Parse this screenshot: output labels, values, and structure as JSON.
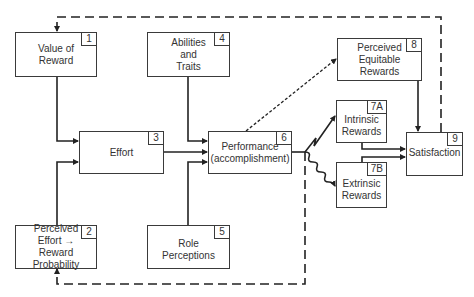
{
  "diagram": {
    "title": "",
    "type": "flowchart",
    "nodes": [
      {
        "id": "1",
        "number": "1",
        "label": "Value of\nReward"
      },
      {
        "id": "2",
        "number": "2",
        "label": "Perceived\nEffort → Reward\nProbability"
      },
      {
        "id": "3",
        "number": "3",
        "label": "Effort"
      },
      {
        "id": "4",
        "number": "4",
        "label": "Abilities\nand\nTraits"
      },
      {
        "id": "5",
        "number": "5",
        "label": "Role Perceptions"
      },
      {
        "id": "6",
        "number": "6",
        "label": "Performance\n(accomplishment)"
      },
      {
        "id": "7A",
        "number": "7A",
        "label": "Intrinsic\nRewards"
      },
      {
        "id": "7B",
        "number": "7B",
        "label": "Extrinsic\nRewards"
      },
      {
        "id": "8",
        "number": "8",
        "label": "Perceived\nEquitable\nRewards"
      },
      {
        "id": "9",
        "number": "9",
        "label": "Satisfaction"
      }
    ],
    "edges": [
      {
        "from": "1",
        "to": "3",
        "style": "solid"
      },
      {
        "from": "2",
        "to": "3",
        "style": "solid"
      },
      {
        "from": "3",
        "to": "6",
        "style": "solid"
      },
      {
        "from": "4",
        "to": "6",
        "style": "solid"
      },
      {
        "from": "5",
        "to": "6",
        "style": "solid"
      },
      {
        "from": "6",
        "to": "8",
        "style": "dotted"
      },
      {
        "from": "6",
        "to": "7A",
        "style": "zigzag"
      },
      {
        "from": "6",
        "to": "7B",
        "style": "wavy"
      },
      {
        "from": "7A",
        "to": "9",
        "style": "solid"
      },
      {
        "from": "7B",
        "to": "9",
        "style": "solid"
      },
      {
        "from": "8",
        "to": "9",
        "style": "solid"
      },
      {
        "from": "9",
        "to": "1",
        "style": "dashed",
        "note": "feedback loop over top"
      },
      {
        "from": "6",
        "to": "2",
        "style": "dashed",
        "note": "feedback loop along bottom"
      }
    ]
  }
}
